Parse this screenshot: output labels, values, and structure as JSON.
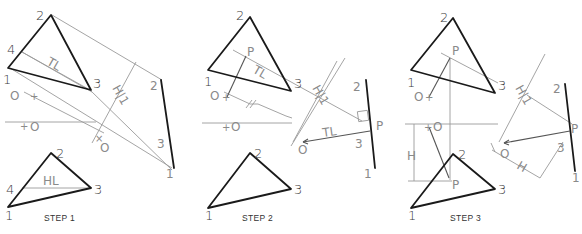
{
  "figure": {
    "steps": [
      {
        "caption": "STEP 1",
        "front_view": {
          "vertices": [
            "1",
            "2",
            "3",
            "4"
          ],
          "line_label": "TL",
          "point_label": "O"
        },
        "top_view": {
          "vertices": [
            "1",
            "2",
            "3",
            "4"
          ],
          "line_label": "HL",
          "point_label": "O"
        },
        "folding_line_label": "H|1",
        "edge_view": {
          "vertices": [
            "2",
            "3",
            "1"
          ],
          "point_label": "O"
        }
      },
      {
        "caption": "STEP 2",
        "front_view": {
          "vertices": [
            "1",
            "2",
            "3"
          ],
          "line_label": "TL",
          "point_label": "O",
          "pierce_label": "P"
        },
        "top_view": {
          "vertices": [
            "1",
            "2",
            "3"
          ],
          "point_label": "O"
        },
        "folding_line_label": "H|1",
        "distance_mark": "//",
        "edge_view": {
          "vertices": [
            "2",
            "3",
            "1"
          ],
          "point_label": "O",
          "pierce_label": "P",
          "line_label": "TL"
        }
      },
      {
        "caption": "STEP 3",
        "front_view": {
          "vertices": [
            "1",
            "2",
            "3"
          ],
          "point_label": "O",
          "pierce_label": "P"
        },
        "top_view": {
          "vertices": [
            "1",
            "2",
            "3"
          ],
          "point_label": "O",
          "pierce_label": "P",
          "dimension_label": "H"
        },
        "folding_line_label": "H|1",
        "edge_view": {
          "vertices": [
            "2",
            "3",
            "1"
          ],
          "point_label": "O",
          "pierce_label": "P",
          "dimension_label": "H"
        }
      }
    ]
  },
  "colors": {
    "object_line": "#1a1a1a",
    "construction_line": "#9a9a9a",
    "label": "#3a3a3a"
  }
}
